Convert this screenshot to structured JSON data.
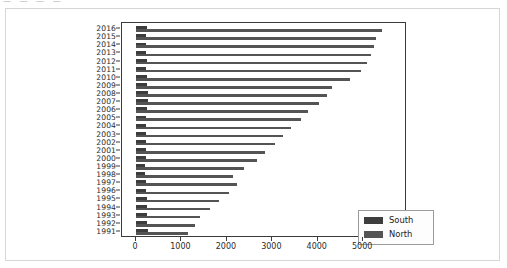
{
  "artifact_text": "— —  —  —",
  "chart_data": {
    "type": "bar",
    "orientation": "horizontal",
    "title": "",
    "xlabel": "",
    "ylabel": "",
    "xlim": [
      0,
      5700
    ],
    "ylim_categories": 26,
    "grid": false,
    "legend_position": "lower right",
    "xticks": [
      0,
      1000,
      2000,
      3000,
      4000,
      5000
    ],
    "xticklabels": [
      "0",
      "1000",
      "2000",
      "3000",
      "4000",
      "5000"
    ],
    "categories": [
      "2016",
      "2015",
      "2014",
      "2013",
      "2012",
      "2011",
      "2010",
      "2009",
      "2008",
      "2007",
      "2006",
      "2005",
      "2004",
      "2003",
      "2002",
      "2001",
      "2000",
      "1999",
      "1998",
      "1997",
      "1996",
      "1995",
      "1994",
      "1993",
      "1992",
      "1991"
    ],
    "series": [
      {
        "name": "South",
        "color": "#3d3d3d",
        "values": [
          240,
          215,
          230,
          225,
          235,
          230,
          245,
          240,
          265,
          255,
          240,
          225,
          215,
          230,
          225,
          230,
          220,
          200,
          190,
          225,
          230,
          235,
          240,
          235,
          250,
          255
        ]
      },
      {
        "name": "North",
        "color": "#545454",
        "values": [
          5410,
          5280,
          5230,
          5170,
          5080,
          4960,
          4720,
          4320,
          4210,
          4020,
          3790,
          3640,
          3410,
          3230,
          3060,
          2840,
          2660,
          2370,
          2130,
          2230,
          2040,
          1830,
          1620,
          1410,
          1290,
          1150
        ]
      }
    ]
  },
  "legend": {
    "items": [
      {
        "label": "South",
        "color": "#3d3d3d"
      },
      {
        "label": "North",
        "color": "#545454"
      }
    ]
  }
}
